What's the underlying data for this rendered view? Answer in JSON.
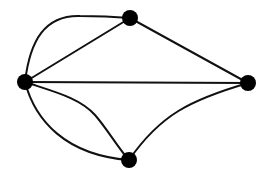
{
  "diagram": {
    "type": "multigraph",
    "background": "#ffffff",
    "edge_color": "#111111",
    "node_color": "#000000",
    "node_radius": 8,
    "nodes": [
      {
        "id": "left",
        "x": 25,
        "y": 82
      },
      {
        "id": "top",
        "x": 130,
        "y": 18
      },
      {
        "id": "right",
        "x": 248,
        "y": 83
      },
      {
        "id": "bottom",
        "x": 129,
        "y": 160
      }
    ],
    "edges": [
      {
        "id": "left-top-arc",
        "from": "left",
        "to": "top",
        "shape": "curve",
        "path": "M25,82 C30,40 45,15 80,16 C105,16 118,17 130,18"
      },
      {
        "id": "left-top-line",
        "from": "left",
        "to": "top",
        "shape": "line",
        "path": "M25,82 L130,18"
      },
      {
        "id": "top-right-line",
        "from": "top",
        "to": "right",
        "shape": "line",
        "path": "M130,18 L248,83"
      },
      {
        "id": "left-right-line",
        "from": "left",
        "to": "right",
        "shape": "line",
        "path": "M25,82 L248,83"
      },
      {
        "id": "left-bottom-upper",
        "from": "left",
        "to": "bottom",
        "shape": "curve",
        "path": "M25,82 C55,92 80,98 95,115 C108,130 118,148 129,160"
      },
      {
        "id": "left-bottom-lower",
        "from": "left",
        "to": "bottom",
        "shape": "curve",
        "path": "M25,82 C35,120 65,155 129,160"
      },
      {
        "id": "bottom-right-curve",
        "from": "bottom",
        "to": "right",
        "shape": "curve",
        "path": "M129,160 C160,115 190,100 248,83"
      }
    ]
  }
}
